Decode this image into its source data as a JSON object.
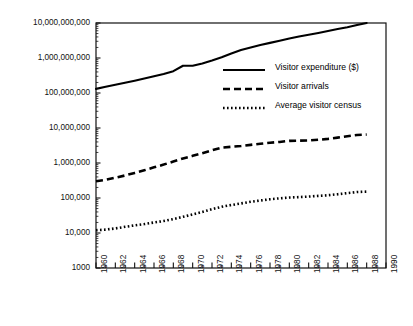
{
  "chart_data": {
    "type": "line",
    "title": "",
    "xlabel": "",
    "ylabel": "",
    "yscale": "log",
    "ylim": [
      1000,
      10000000000
    ],
    "xlim": [
      1960,
      1990
    ],
    "grid": false,
    "legend_position": "upper right (inside plot)",
    "y_tick_labels": [
      "10,000,000,000",
      "1,000,000,000",
      "100,000,000",
      "10,000,000",
      "1,000,000",
      "100,000",
      "10,000",
      "1000"
    ],
    "y_tick_values": [
      10000000000,
      1000000000,
      100000000,
      10000000,
      1000000,
      100000,
      10000,
      1000
    ],
    "x_tick_labels": [
      "1960",
      "1962",
      "1964",
      "1966",
      "1968",
      "1970",
      "1972",
      "1974",
      "1976",
      "1978",
      "1980",
      "1982",
      "1984",
      "1986",
      "1988",
      "1990"
    ],
    "x_tick_values": [
      1960,
      1962,
      1964,
      1966,
      1968,
      1970,
      1972,
      1974,
      1976,
      1978,
      1980,
      1982,
      1984,
      1986,
      1988,
      1990
    ],
    "x_minor_tick_step": 1,
    "x": [
      1960,
      1961,
      1962,
      1963,
      1964,
      1965,
      1966,
      1967,
      1968,
      1969,
      1970,
      1971,
      1972,
      1973,
      1974,
      1975,
      1976,
      1977,
      1978,
      1979,
      1980,
      1981,
      1982,
      1983,
      1984,
      1985,
      1986,
      1987,
      1988
    ],
    "series": [
      {
        "name": "Visitor expenditure ($)",
        "style": "solid",
        "color": "#000000",
        "values": [
          131000000,
          150000000,
          172000000,
          196000000,
          225000000,
          258000000,
          300000000,
          350000000,
          420000000,
          600000000,
          600000000,
          700000000,
          850000000,
          1050000000,
          1350000000,
          1700000000,
          2000000000,
          2350000000,
          2700000000,
          3100000000,
          3600000000,
          4100000000,
          4600000000,
          5200000000,
          5900000000,
          6700000000,
          7600000000,
          8800000000,
          10000000000
        ]
      },
      {
        "name": "Visitor arrivals",
        "style": "dashed",
        "color": "#000000",
        "values": [
          300000,
          330000,
          380000,
          440000,
          520000,
          620000,
          750000,
          900000,
          1100000,
          1350000,
          1600000,
          1900000,
          2300000,
          2750000,
          2900000,
          3050000,
          3300000,
          3550000,
          3800000,
          4000000,
          4300000,
          4350000,
          4400000,
          4600000,
          4900000,
          5300000,
          5800000,
          6300000,
          6500000
        ]
      },
      {
        "name": "Average visitor census",
        "style": "dotted",
        "color": "#000000",
        "values": [
          12000,
          12500,
          13500,
          15000,
          16500,
          18000,
          20000,
          22000,
          25000,
          29000,
          34000,
          40000,
          48000,
          56000,
          63000,
          70000,
          78000,
          85000,
          92000,
          98000,
          103000,
          106000,
          110000,
          115000,
          120000,
          128000,
          138000,
          148000,
          152000
        ]
      }
    ]
  },
  "legend": {
    "items": [
      {
        "label": "Visitor expenditure ($)",
        "style": "solid"
      },
      {
        "label": "Visitor arrivals",
        "style": "dashed"
      },
      {
        "label": "Average visitor census",
        "style": "dotted"
      }
    ]
  }
}
